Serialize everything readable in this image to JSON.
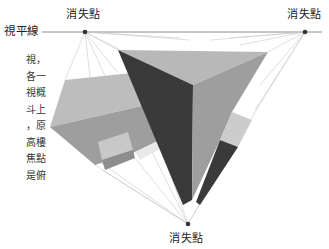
{
  "labels": {
    "horizon": "視平線",
    "vp_left": "消失點",
    "vp_right": "消失點",
    "vp_bottom": "消失點"
  },
  "side_text_lines": [
    "視，",
    "各一",
    "視概",
    "斗上",
    "，原",
    "高樓",
    "焦點",
    "是俯"
  ],
  "colors": {
    "horizon_line": "#8a8a8a",
    "guide_line": "#c8c8c8",
    "vanishing_point": "#333333",
    "face_light": "#bdbdbd",
    "face_medium": "#9e9e9e",
    "face_dark": "#3a3a3a",
    "face_pale": "#cfcfcf"
  },
  "geometry": {
    "vanishing_points": {
      "left": [
        85,
        32
      ],
      "right": [
        305,
        32
      ],
      "bottom": [
        188,
        224
      ]
    }
  }
}
